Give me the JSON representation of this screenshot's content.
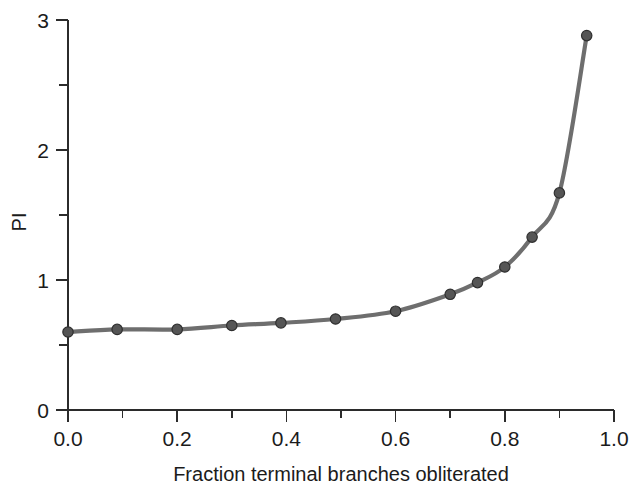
{
  "figure": {
    "width": 631,
    "height": 487,
    "background": "#ffffff"
  },
  "chart_data": {
    "type": "line",
    "title": "",
    "subtitle": "",
    "xlabel": "Fraction terminal branches obliterated",
    "ylabel": "PI",
    "xlim": [
      0.0,
      1.0
    ],
    "ylim": [
      0,
      3
    ],
    "grid": false,
    "legend": false,
    "legend_position": "none",
    "x_major_ticks": [
      0.0,
      0.2,
      0.4,
      0.6,
      0.8,
      1.0
    ],
    "x_major_tick_labels": [
      "0.0",
      "0.2",
      "0.4",
      "0.6",
      "0.8",
      "1.0"
    ],
    "x_minor_ticks": [
      0.1,
      0.3,
      0.5,
      0.7,
      0.9
    ],
    "y_major_ticks": [
      0,
      1,
      2,
      3
    ],
    "y_major_tick_labels": [
      "0",
      "1",
      "2",
      "3"
    ],
    "y_minor_ticks": [
      0.5,
      1.5,
      2.5
    ],
    "series": [
      {
        "name": "PI",
        "line_color": "#6e6e6e",
        "marker_color": "#555555",
        "marker_edge_color": "#2f2f2f",
        "marker": "circle",
        "x": [
          0.0,
          0.09,
          0.2,
          0.3,
          0.39,
          0.49,
          0.6,
          0.7,
          0.75,
          0.8,
          0.85,
          0.9,
          0.95
        ],
        "values": [
          0.6,
          0.62,
          0.62,
          0.65,
          0.67,
          0.7,
          0.76,
          0.89,
          0.98,
          1.1,
          1.33,
          1.67,
          2.88
        ]
      }
    ]
  },
  "axes": {
    "y_axis_label": "PI",
    "x_axis_label": "Fraction terminal branches obliterated"
  }
}
